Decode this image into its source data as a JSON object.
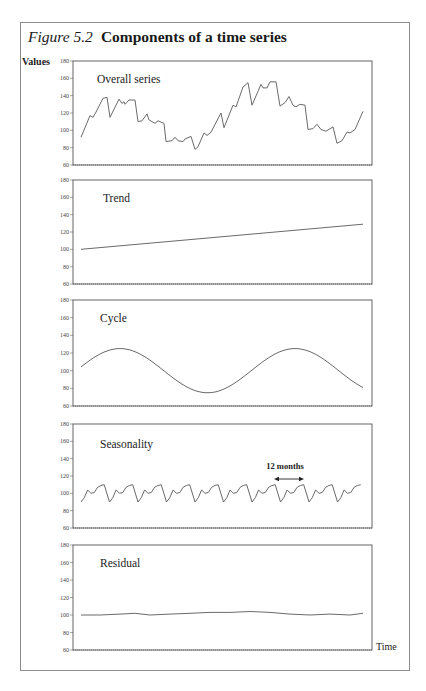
{
  "figure": {
    "label": "Figure 5.2",
    "title": "Components of a time series",
    "y_axis_label": "Values",
    "x_axis_label": "Time"
  },
  "chart_data": [
    {
      "type": "line",
      "title": "Overall series",
      "ylabel": "Values",
      "xlabel": "Time",
      "ylim": [
        60,
        180
      ],
      "yticks": [
        60,
        80,
        100,
        120,
        140,
        160,
        180
      ],
      "grid": false,
      "x": [
        81,
        90,
        93,
        96,
        103,
        107,
        110,
        119,
        122,
        124,
        125,
        129,
        135,
        138,
        142,
        147,
        149,
        155,
        158,
        164,
        166,
        172,
        175,
        178,
        183,
        185,
        191,
        195,
        198,
        204,
        207,
        211,
        221,
        224,
        233,
        236,
        243,
        248,
        252,
        261,
        263,
        267,
        270,
        276,
        280,
        285,
        289,
        293,
        296,
        300,
        305,
        308,
        313,
        317,
        321,
        326,
        333,
        337,
        342,
        347,
        350,
        355,
        363
      ],
      "values": [
        92,
        117,
        115,
        121,
        137,
        138,
        115,
        136,
        131,
        133,
        130,
        135,
        135,
        110,
        111,
        119,
        112,
        108,
        111,
        108,
        87,
        88,
        92,
        88,
        87,
        90,
        93,
        78,
        81,
        97,
        94,
        98,
        120,
        103,
        129,
        127,
        150,
        155,
        129,
        153,
        149,
        149,
        156,
        156,
        128,
        132,
        139,
        129,
        127,
        130,
        129,
        101,
        102,
        107,
        101,
        99,
        104,
        85,
        88,
        98,
        97,
        101,
        122
      ]
    },
    {
      "type": "line",
      "title": "Trend",
      "ylim": [
        60,
        180
      ],
      "yticks": [
        60,
        80,
        100,
        120,
        140,
        160,
        180
      ],
      "x": [
        81,
        363
      ],
      "values": [
        100,
        129
      ]
    },
    {
      "type": "line",
      "title": "Cycle",
      "ylim": [
        60,
        180
      ],
      "yticks": [
        60,
        80,
        100,
        120,
        140,
        160,
        180
      ],
      "description": "Sinusoid, mean 100, amplitude 25, period ~1.6 x-span, starts near 104 rising",
      "x": [
        81,
        95,
        110,
        123,
        140,
        160,
        180,
        195,
        210,
        225,
        240,
        255,
        270,
        285,
        300,
        315,
        330,
        345,
        363
      ],
      "values": [
        104,
        116,
        124,
        124,
        116,
        98,
        81,
        76,
        80,
        94,
        112,
        123,
        125,
        118,
        103,
        86,
        77,
        79,
        90
      ]
    },
    {
      "type": "line",
      "title": "Seasonality",
      "ylim": [
        60,
        180
      ],
      "yticks": [
        60,
        80,
        100,
        120,
        140,
        160,
        180
      ],
      "annotation": "12 months",
      "period_px": 28.5,
      "cycle_pattern": [
        90,
        95,
        104,
        100,
        101,
        107,
        109,
        110,
        90
      ],
      "cycles": 10
    },
    {
      "type": "line",
      "title": "Residual",
      "ylim": [
        60,
        180
      ],
      "yticks": [
        60,
        80,
        100,
        120,
        140,
        160,
        180
      ],
      "x": [
        81,
        100,
        120,
        135,
        150,
        170,
        190,
        210,
        230,
        250,
        270,
        290,
        310,
        330,
        350,
        363
      ],
      "values": [
        100,
        100,
        101,
        102,
        100,
        101,
        102,
        103,
        103,
        104,
        103,
        101,
        100,
        101,
        100,
        102
      ]
    }
  ]
}
